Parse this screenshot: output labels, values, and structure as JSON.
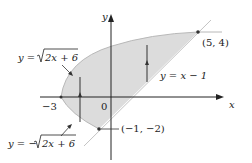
{
  "figure": {
    "axes": {
      "x_label": "x",
      "y_label": "y"
    },
    "ticks": {
      "neg_three": "−3",
      "zero": "0"
    },
    "curves": {
      "upper": {
        "label_prefix": "y = ",
        "label_radical": "2x + 6",
        "sign": ""
      },
      "lower": {
        "label_prefix": "y = −",
        "label_radical": "2x + 6",
        "sign": "−"
      },
      "line": {
        "label": "y = x − 1"
      }
    },
    "points": {
      "top_intersection": "(5, 4)",
      "bottom_intersection": "(−1, −2)"
    },
    "colors": {
      "region_fill": "#dcdcdc",
      "curve": "#b0b0b0",
      "axis": "#222222"
    }
  }
}
